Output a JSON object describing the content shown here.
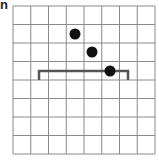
{
  "panel_label": "n",
  "grid": {
    "cols": 8,
    "rows": 8,
    "x0": 13,
    "y0": 6,
    "x1": 155,
    "y1": 154,
    "line_color": "#8a8a8a"
  },
  "dots": [
    {
      "x": 75,
      "y": 34
    },
    {
      "x": 92,
      "y": 52
    },
    {
      "x": 110,
      "y": 71
    }
  ],
  "bracket": {
    "x_left": 39,
    "x_right": 128,
    "y_top": 71,
    "y_bottom": 80,
    "color": "#555555"
  },
  "dot_color": "#111111"
}
